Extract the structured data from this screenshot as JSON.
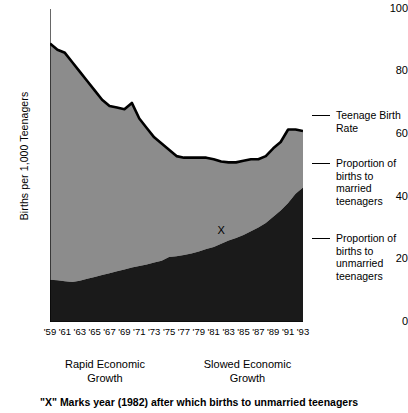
{
  "chart_data": {
    "type": "area",
    "title": "",
    "xlabel": "",
    "ylabel": "Births per 1,000 Teenagers",
    "ylim": [
      0,
      100
    ],
    "yticks": [
      0,
      20,
      40,
      60,
      80,
      100
    ],
    "ytick_labels": [
      "0",
      "20",
      "40",
      "60",
      "80",
      "100"
    ],
    "minor_ytick_step": 10,
    "grid": false,
    "legend_position": "right",
    "stacked": true,
    "xlim": [
      1959,
      1993
    ],
    "x": [
      1959,
      1960,
      1961,
      1962,
      1963,
      1964,
      1965,
      1966,
      1967,
      1968,
      1969,
      1970,
      1971,
      1972,
      1973,
      1974,
      1975,
      1976,
      1977,
      1978,
      1979,
      1980,
      1981,
      1982,
      1983,
      1984,
      1985,
      1986,
      1987,
      1988,
      1989,
      1990,
      1991,
      1992,
      1993
    ],
    "xtick_labels": [
      "'59",
      "'61",
      "'63",
      "'65",
      "'67",
      "'69",
      "'71",
      "'73",
      "'75",
      "'77",
      "'79",
      "'81",
      "'83",
      "'85",
      "'87",
      "'89",
      "'91",
      "'93"
    ],
    "xtick_values": [
      1959,
      1961,
      1963,
      1965,
      1967,
      1969,
      1971,
      1973,
      1975,
      1977,
      1979,
      1981,
      1983,
      1985,
      1987,
      1989,
      1991,
      1993
    ],
    "series": [
      {
        "name": "Proportion of births to unmarried teenagers",
        "color": "#1a1a1a",
        "values": [
          13.5,
          13.3,
          13.0,
          12.8,
          13.2,
          13.8,
          14.4,
          15.0,
          15.6,
          16.2,
          16.8,
          17.4,
          17.9,
          18.4,
          19.0,
          19.6,
          20.8,
          21.0,
          21.4,
          21.9,
          22.5,
          23.3,
          24.0,
          25.0,
          26.0,
          26.8,
          27.8,
          29.0,
          30.2,
          31.6,
          33.6,
          35.6,
          38.0,
          41.0,
          43.0
        ]
      },
      {
        "name": "Proportion of births to married teenagers",
        "color": "#8c8c8c",
        "values": [
          75.5,
          73.7,
          73.0,
          70.2,
          66.8,
          63.2,
          59.6,
          56.0,
          53.4,
          52.3,
          51.2,
          52.6,
          47.1,
          43.6,
          40.0,
          37.4,
          34.2,
          32.0,
          31.1,
          30.6,
          30.0,
          29.2,
          28.0,
          26.3,
          25.0,
          24.2,
          23.7,
          23.0,
          21.8,
          21.4,
          21.9,
          21.9,
          23.5,
          20.5,
          18.0
        ]
      }
    ],
    "total_series": {
      "name": "Teenage Birth Rate",
      "color": "#000000",
      "values": [
        89.0,
        87.0,
        86.0,
        83.0,
        80.0,
        77.0,
        74.0,
        71.0,
        69.0,
        68.5,
        68.0,
        70.0,
        65.0,
        62.0,
        59.0,
        57.0,
        55.0,
        53.0,
        52.5,
        52.5,
        52.5,
        52.5,
        52.0,
        51.3,
        51.0,
        51.0,
        51.5,
        52.0,
        52.0,
        53.0,
        55.5,
        57.5,
        61.5,
        61.5,
        61.0
      ]
    },
    "annotations": [
      {
        "name": "x-marker",
        "label": "X",
        "year": 1982,
        "value": 29.0
      }
    ]
  },
  "legend": {
    "items": [
      {
        "label_lines": [
          "Teenage Birth",
          "Rate"
        ],
        "name": "teenage-birth-rate"
      },
      {
        "label_lines": [
          "Proportion of",
          "births to",
          "married",
          "teenagers"
        ],
        "name": "married-teenagers"
      },
      {
        "label_lines": [
          "Proportion of",
          "births to",
          "unmarried",
          "teenagers"
        ],
        "name": "unmarried-teenagers"
      }
    ],
    "teenage_birth_rate_l1": "Teenage Birth",
    "teenage_birth_rate_l2": "Rate",
    "married_l1": "Proportion of",
    "married_l2": "births to",
    "married_l3": "married",
    "married_l4": "teenagers",
    "unmarried_l1": "Proportion of",
    "unmarried_l2": "births to",
    "unmarried_l3": "unmarried",
    "unmarried_l4": "teenagers"
  },
  "eras": {
    "left_l1": "Rapid Economic",
    "left_l2": "Growth",
    "right_l1": "Slowed Economic",
    "right_l2": "Growth"
  },
  "caption": {
    "text": "\"X\" Marks year (1982) after which births to unmarried teenagers"
  },
  "axis": {
    "y_title": "Births per 1,000 Teenagers",
    "y_0": "0",
    "y_20": "20",
    "y_40": "40",
    "y_60": "60",
    "y_80": "80",
    "y_100": "100"
  }
}
